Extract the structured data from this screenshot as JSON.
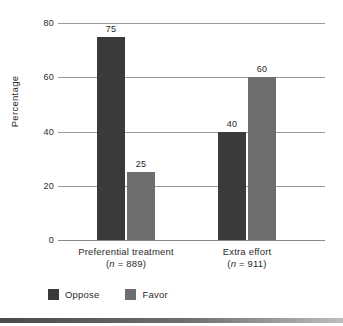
{
  "chart_data": {
    "type": "bar",
    "title": "",
    "xlabel": "",
    "ylabel": "Percentage",
    "ylim": [
      0,
      80
    ],
    "yticks": [
      0,
      20,
      40,
      60,
      80
    ],
    "ytick_labels": [
      "0",
      "20",
      "40",
      "60",
      "80"
    ],
    "grid": true,
    "legend_position": "bottom-left",
    "categories": [
      "Preferential treatment",
      "Extra effort"
    ],
    "category_sublabels": [
      "(n = 889)",
      "(n = 911)"
    ],
    "category_n": [
      889,
      911
    ],
    "series": [
      {
        "name": "Oppose",
        "color": "#3a3a3a",
        "values": [
          75,
          40
        ],
        "value_labels": [
          "75",
          "40"
        ]
      },
      {
        "name": "Favor",
        "color": "#6e6e6e",
        "values": [
          25,
          60
        ],
        "value_labels": [
          "25",
          "60"
        ]
      }
    ]
  },
  "axis": {
    "y_title": "Percentage"
  },
  "legend": {
    "items": [
      {
        "label": "Oppose",
        "color": "#3a3a3a"
      },
      {
        "label": "Favor",
        "color": "#6e6e6e"
      }
    ]
  }
}
